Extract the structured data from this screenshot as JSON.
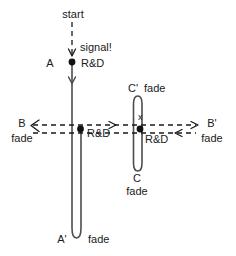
{
  "diagram": {
    "canvas": {
      "width": 236,
      "height": 256,
      "background": "#ffffff"
    },
    "colors": {
      "solid_stroke": "#4d4d4d",
      "dashed_stroke": "#1a1a1a",
      "node_fill": "#111111",
      "text": "#1a1a1a"
    },
    "labels": {
      "start": "start",
      "signal": "signal!",
      "node_a": "A",
      "node_a_rd": "R&D",
      "node_a_prime": "A'",
      "node_a_prime_fade": "fade",
      "node_b": "B",
      "node_b_fade": "fade",
      "node_b_rd": "R&D",
      "node_b_prime": "B'",
      "node_b_prime_fade": "fade",
      "node_c": "C",
      "node_c_fade": "fade",
      "node_c_rd": "R&D",
      "node_c_prime": "C'",
      "node_c_prime_fade": "fade",
      "cross_mark": "x"
    }
  }
}
